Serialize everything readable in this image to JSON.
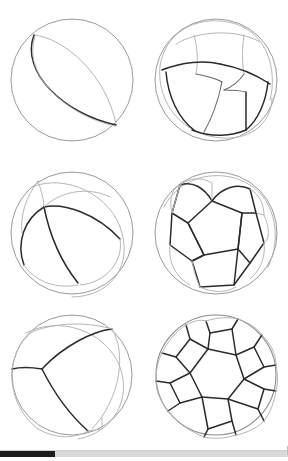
{
  "document": {
    "title": "Spherical tessellations plate",
    "background_color": "#ffffff",
    "figure_count": 6,
    "grid_columns": 2,
    "grid_rows": 3
  },
  "palette": {
    "front_edge": "#2b2b2b",
    "mid_edge": "#6d6d6d",
    "back_edge": "#b6b6b6",
    "sphere_outline": "#9a9a9a",
    "scrollbar_thumb": "#1c1c1c",
    "scrollbar_track": "#d9d9d9"
  },
  "figures": [
    {
      "id": "figure-dihedron",
      "position": "top-left",
      "name": "spherical dihedron",
      "caption": "",
      "faces": 2,
      "sphere": {
        "cx": 72,
        "cy": 77,
        "r": 62
      },
      "description": "Sphere with a single great circle dividing it into two lune faces."
    },
    {
      "id": "figure-hexahedron",
      "position": "top-right",
      "name": "spherical hexahedron",
      "caption": "",
      "faces": 6,
      "sphere": {
        "cx": 72,
        "cy": 77,
        "r": 62
      },
      "description": "Sphere tessellated into six curved quadrilateral faces, a cube projected outward."
    },
    {
      "id": "figure-hosohedron",
      "position": "middle-left",
      "name": "spherical hosohedron",
      "caption": "",
      "faces": 3,
      "sphere": {
        "cx": 72,
        "cy": 77,
        "r": 62
      },
      "description": "Sphere divided into three lunes meeting at two poles."
    },
    {
      "id": "figure-dodecahedron",
      "position": "middle-right",
      "name": "spherical dodecahedron",
      "caption": "",
      "faces": 12,
      "sphere": {
        "cx": 72,
        "cy": 77,
        "r": 62
      },
      "description": "Sphere tessellated into twelve curved pentagonal faces."
    },
    {
      "id": "figure-tetrahedron",
      "position": "bottom-left",
      "name": "spherical tetrahedron",
      "caption": "",
      "faces": 4,
      "sphere": {
        "cx": 72,
        "cy": 68,
        "r": 62
      },
      "description": "Sphere tessellated into four curved triangular faces."
    },
    {
      "id": "figure-truncated-icosahedron",
      "position": "bottom-right",
      "name": "spherical truncated icosahedron",
      "caption": "",
      "faces": 32,
      "sphere": {
        "cx": 72,
        "cy": 68,
        "r": 62
      },
      "description": "Soccer-ball tessellation of pentagons and hexagons on the sphere."
    }
  ],
  "scrollbar": {
    "orientation": "horizontal",
    "thumb_start_px": 0,
    "thumb_width_px": 55,
    "track_width_px": 288,
    "thumb_fraction_percent": 19
  }
}
